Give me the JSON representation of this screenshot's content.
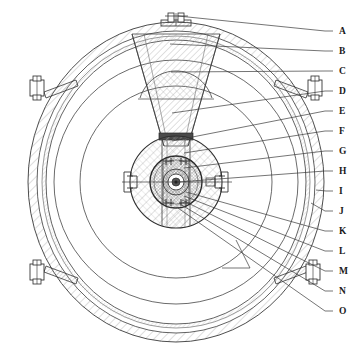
{
  "figure": {
    "type": "engineering-cross-section",
    "background_color": "#ffffff",
    "line_color": "#3a3a3a",
    "hatch_color": "#8f8f8f",
    "dark_block_color": "#4a4a4a",
    "width": 364,
    "height": 350
  },
  "callouts": {
    "items": [
      {
        "id": "A",
        "label": "A",
        "x": 339,
        "y": 31,
        "leader_to_x": 178,
        "leader_to_y": 16
      },
      {
        "id": "B",
        "label": "B",
        "x": 339,
        "y": 51,
        "leader_to_x": 170,
        "leader_to_y": 44
      },
      {
        "id": "C",
        "label": "C",
        "x": 339,
        "y": 71,
        "leader_to_x": 171,
        "leader_to_y": 72
      },
      {
        "id": "D",
        "label": "D",
        "x": 339,
        "y": 91,
        "leader_to_x": 172,
        "leader_to_y": 113
      },
      {
        "id": "E",
        "label": "E",
        "x": 339,
        "y": 111,
        "leader_to_x": 172,
        "leader_to_y": 141
      },
      {
        "id": "F",
        "label": "F",
        "x": 339,
        "y": 131,
        "leader_to_x": 184,
        "leader_to_y": 153
      },
      {
        "id": "G",
        "label": "G",
        "x": 339,
        "y": 151,
        "leader_to_x": 184,
        "leader_to_y": 168
      },
      {
        "id": "H",
        "label": "H",
        "x": 339,
        "y": 171,
        "leader_to_x": 178,
        "leader_to_y": 182
      },
      {
        "id": "I",
        "label": "I",
        "x": 339,
        "y": 191,
        "leader_to_x": 316,
        "leader_to_y": 190
      },
      {
        "id": "J",
        "label": "J",
        "x": 339,
        "y": 211,
        "leader_to_x": 311,
        "leader_to_y": 203
      },
      {
        "id": "K",
        "label": "K",
        "x": 339,
        "y": 231,
        "leader_to_x": 186,
        "leader_to_y": 192
      },
      {
        "id": "L",
        "label": "L",
        "x": 339,
        "y": 251,
        "leader_to_x": 184,
        "leader_to_y": 196
      },
      {
        "id": "M",
        "label": "M",
        "x": 339,
        "y": 271,
        "leader_to_x": 182,
        "leader_to_y": 200
      },
      {
        "id": "N",
        "label": "N",
        "x": 339,
        "y": 291,
        "leader_to_x": 180,
        "leader_to_y": 204
      },
      {
        "id": "O",
        "label": "O",
        "x": 339,
        "y": 311,
        "leader_to_x": 178,
        "leader_to_y": 208
      }
    ]
  },
  "geometry": {
    "center": {
      "cx": 176,
      "cy": 182
    },
    "shell": {
      "outer_rx": 148,
      "outer_ry": 160,
      "wall_bands": [
        0,
        5,
        10
      ]
    },
    "concentric_circles": [
      {
        "name": "outer-inner-ring",
        "r": 122
      },
      {
        "name": "mid-ring",
        "r": 96
      },
      {
        "name": "hub-outer-ring",
        "r": 46
      },
      {
        "name": "bearing-ring",
        "r": 26
      },
      {
        "name": "shaft-ring",
        "r": 13
      },
      {
        "name": "shaft-core",
        "r": 5
      }
    ],
    "wedge": {
      "apex_half_width": 12,
      "top_half_width": 44,
      "top_y": 26
    },
    "dark_block": {
      "x": 160,
      "y": 134,
      "w": 33,
      "h": 7
    },
    "brackets": [
      {
        "name": "top-stud",
        "angle_deg": -90
      },
      {
        "name": "upper-left-bracket",
        "angle_deg": 196
      },
      {
        "name": "upper-right-bracket",
        "angle_deg": -16
      },
      {
        "name": "lower-left-bracket",
        "angle_deg": 160
      },
      {
        "name": "lower-right-bracket",
        "angle_deg": 20
      }
    ]
  }
}
